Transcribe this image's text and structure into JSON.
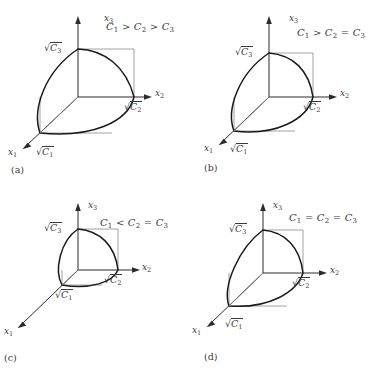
{
  "figure": {
    "type": "technical-diagram",
    "background_color": "#ffffff",
    "line_color": "#1a1a1a",
    "text_color": "#3a3a3a"
  },
  "axis_names": {
    "x1": "x",
    "x1_sub": "1",
    "x2": "x",
    "x2_sub": "2",
    "x3": "x",
    "x3_sub": "3"
  },
  "intercepts": {
    "c1_sub": "1",
    "c2_sub": "2",
    "c3_sub": "3",
    "radical_sign": "√",
    "base_letter": "C"
  },
  "panels": [
    {
      "id": "a",
      "tag": "(a)",
      "condition_parts": [
        "C",
        "1",
        " > ",
        "C",
        "2",
        " > ",
        "C",
        "3"
      ],
      "condition_text": "C1 > C2 > C3",
      "relation_12": ">",
      "relation_23": ">",
      "axis_labels": {
        "x3": "x3",
        "x2": "x2",
        "x1": "x1"
      },
      "intercept_labels": {
        "x3": "√C3",
        "x2": "√C2",
        "x1": "√C1"
      },
      "relative_extents": {
        "c1": 1.0,
        "c2": 0.72,
        "c3": 0.52
      }
    },
    {
      "id": "b",
      "tag": "(b)",
      "condition_parts": [
        "C",
        "1",
        " > ",
        "C",
        "2",
        " = ",
        "C",
        "3"
      ],
      "condition_text": "C1 > C2 = C3",
      "relation_12": ">",
      "relation_23": "=",
      "axis_labels": {
        "x3": "x3",
        "x2": "x2",
        "x1": "x1"
      },
      "intercept_labels": {
        "x3": "√C3",
        "x2": "√C2",
        "x1": "√C1"
      },
      "relative_extents": {
        "c1": 1.0,
        "c2": 0.62,
        "c3": 0.62
      }
    },
    {
      "id": "c",
      "tag": "(c)",
      "condition_parts": [
        "C",
        "1",
        " < ",
        "C",
        "2",
        " = ",
        "C",
        "3"
      ],
      "condition_text": "C1 < C2 = C3",
      "relation_12": "<",
      "relation_23": "=",
      "axis_labels": {
        "x3": "x3",
        "x2": "x2",
        "x1": "x1"
      },
      "intercept_labels": {
        "x3": "√C3",
        "x2": "√C2",
        "x1": "√C1"
      },
      "relative_extents": {
        "c1": 0.28,
        "c2": 0.62,
        "c3": 0.62
      }
    },
    {
      "id": "d",
      "tag": "(d)",
      "condition_parts": [
        "C",
        "1",
        " = ",
        "C",
        "2",
        " = ",
        "C",
        "3"
      ],
      "condition_text": "C1 = C2 = C3",
      "relation_12": "=",
      "relation_23": "=",
      "axis_labels": {
        "x3": "x3",
        "x2": "x2",
        "x1": "x1"
      },
      "intercept_labels": {
        "x3": "√C3",
        "x2": "√C2",
        "x1": "√C1"
      },
      "relative_extents": {
        "c1": 0.68,
        "c2": 0.62,
        "c3": 0.62
      }
    }
  ],
  "caption_ghost": ""
}
